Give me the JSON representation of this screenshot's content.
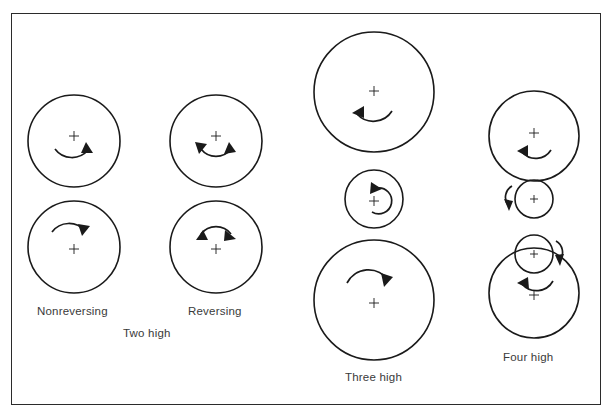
{
  "figure": {
    "background_color": "#ffffff",
    "stroke_color": "#1a1a1a",
    "text_color": "#3a3a3a",
    "frame": {
      "x": 11,
      "y": 13,
      "width": 590,
      "height": 392
    }
  },
  "captions": {
    "nonreversing": "Nonreversing",
    "reversing": "Reversing",
    "two_high": "Two high",
    "three_high": "Three high",
    "four_high": "Four high"
  },
  "caption_positions": {
    "nonreversing": {
      "x": 37,
      "y": 305
    },
    "reversing": {
      "x": 188,
      "y": 305
    },
    "two_high": {
      "x": 123,
      "y": 327
    },
    "three_high": {
      "x": 345,
      "y": 371
    },
    "four_high": {
      "x": 503,
      "y": 351
    }
  },
  "configurations": [
    {
      "name": "nonreversing-two-high",
      "label": "Nonreversing",
      "group": "Two high",
      "rolls": [
        {
          "id": "nonrev-top-roll",
          "cx": 74,
          "cy": 141,
          "r": 46,
          "kind": "work-roll",
          "arrow": "single-clockwise",
          "arrow_position": "below-center"
        },
        {
          "id": "nonrev-bottom-roll",
          "cx": 74,
          "cy": 247,
          "r": 46,
          "kind": "work-roll",
          "arrow": "single-clockwise",
          "arrow_position": "above-center"
        }
      ]
    },
    {
      "name": "reversing-two-high",
      "label": "Reversing",
      "group": "Two high",
      "rolls": [
        {
          "id": "rev-top-roll",
          "cx": 216,
          "cy": 141,
          "r": 46,
          "kind": "work-roll",
          "arrow": "double-headed",
          "arrow_position": "below-center"
        },
        {
          "id": "rev-bottom-roll",
          "cx": 216,
          "cy": 247,
          "r": 46,
          "kind": "work-roll",
          "arrow": "double-headed",
          "arrow_position": "above-center"
        }
      ]
    },
    {
      "name": "three-high",
      "label": "Three high",
      "group": "Three high",
      "rolls": [
        {
          "id": "three-high-top-roll",
          "cx": 374,
          "cy": 92,
          "r": 60,
          "kind": "work-roll",
          "arrow": "single-counterclockwise",
          "arrow_position": "below-center"
        },
        {
          "id": "three-high-middle-roll",
          "cx": 374,
          "cy": 199,
          "r": 29,
          "kind": "small-work-roll",
          "arrow": "loop-counterclockwise",
          "arrow_position": "center"
        },
        {
          "id": "three-high-bottom-roll",
          "cx": 374,
          "cy": 300,
          "r": 60,
          "kind": "work-roll",
          "arrow": "single-clockwise",
          "arrow_position": "above-center"
        }
      ]
    },
    {
      "name": "four-high",
      "label": "Four high",
      "group": "Four high",
      "rolls": [
        {
          "id": "four-high-top-backup-roll",
          "cx": 534,
          "cy": 136,
          "r": 45,
          "kind": "backup-roll",
          "arrow": "single-counterclockwise",
          "arrow_position": "below-center"
        },
        {
          "id": "four-high-top-work-roll",
          "cx": 534,
          "cy": 199,
          "r": 19,
          "kind": "work-roll",
          "arrow": "side-left-down",
          "arrow_position": "left-outside"
        },
        {
          "id": "four-high-bottom-work-roll",
          "cx": 534,
          "cy": 254,
          "r": 19,
          "kind": "work-roll",
          "arrow": "side-right-down",
          "arrow_position": "right-outside"
        },
        {
          "id": "four-high-bottom-backup-roll",
          "cx": 534,
          "cy": 293,
          "r": 45,
          "kind": "backup-roll",
          "arrow": "single-counterclockwise",
          "arrow_position": "above-center"
        }
      ]
    }
  ],
  "center_marks": {
    "glyph": "+",
    "size": 9
  }
}
